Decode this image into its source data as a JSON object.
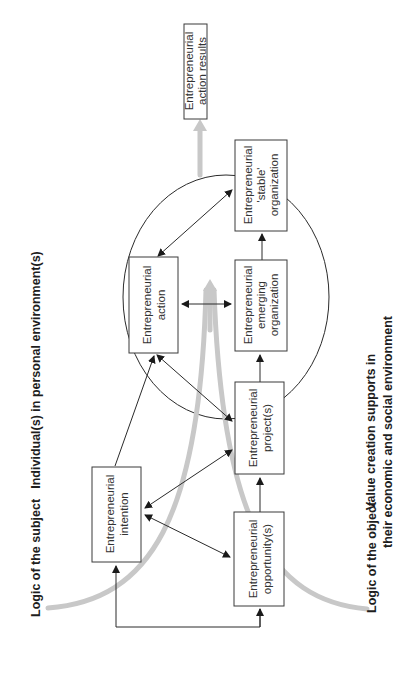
{
  "diagram": {
    "orientation": "rotated -90deg (text reads bottom-to-top)",
    "headings": {
      "individuals": "Individual(s) in personal environment(s)",
      "logic_subject": "Logic of the subject",
      "logic_object": "Logic of the object",
      "value_creation_line1": "Value creation supports in",
      "value_creation_line2": "their economic and social environment"
    },
    "boxes": {
      "action_results": {
        "line1": "Entrepreneurial",
        "line2": "action results"
      },
      "stable_org": {
        "line1": "Entrepreneurial",
        "line2": "'stable'",
        "line3": "organization"
      },
      "action": {
        "line1": "Entrepreneurial",
        "line2": "action"
      },
      "emerging_org": {
        "line1": "Entrepreneurial",
        "line2": "emerging",
        "line3": "organization"
      },
      "intention": {
        "line1": "Entrepreneurial",
        "line2": "intention"
      },
      "project": {
        "line1": "Entrepreneurial",
        "line2": "project(s)"
      },
      "opportunity": {
        "line1": "Entrepreneurial",
        "line2": "opportunity(s)"
      }
    },
    "connections": [
      {
        "from": "opportunity",
        "to": "project",
        "type": "arrow"
      },
      {
        "from": "project",
        "to": "emerging_org",
        "type": "arrow"
      },
      {
        "from": "emerging_org",
        "to": "stable_org",
        "type": "arrow"
      },
      {
        "from": "action",
        "to": "emerging_org",
        "type": "double-arrow"
      },
      {
        "from": "action",
        "to": "stable_org",
        "type": "double-arrow"
      },
      {
        "from": "action",
        "to": "project",
        "type": "double-arrow"
      },
      {
        "from": "intention",
        "to": "action",
        "type": "arrow"
      },
      {
        "from": "intention",
        "to": "project",
        "type": "double-arrow"
      },
      {
        "from": "intention",
        "to": "opportunity",
        "type": "double-arrow"
      },
      {
        "from": "opportunity",
        "to": "intention",
        "type": "elbow-arrow"
      }
    ],
    "colors": {
      "box_stroke": "#3a3a3a",
      "flow_arrow": "#c8c8c8",
      "text": "#222222",
      "background": "#ffffff"
    }
  }
}
